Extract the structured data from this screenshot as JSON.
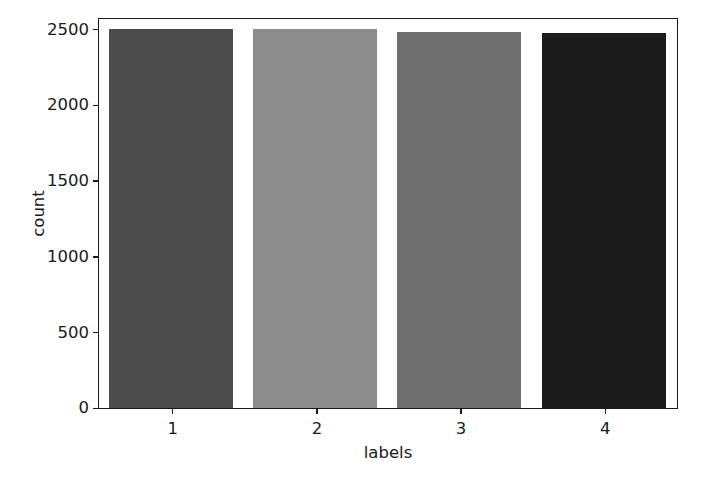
{
  "figure": {
    "width": 701,
    "height": 479,
    "background_color": "#ffffff",
    "spine_color": "#1a1a1a",
    "text_color": "#1a1a1a"
  },
  "chart_data": {
    "type": "bar",
    "title": "",
    "xlabel": "labels",
    "ylabel": "count",
    "categories": [
      "1",
      "2",
      "3",
      "4"
    ],
    "values": [
      2500,
      2500,
      2482,
      2478
    ],
    "bar_colors": [
      "#4c4c4c",
      "#8d8d8d",
      "#6e6e6e",
      "#1b1b1b"
    ],
    "xtick_labels": [
      "1",
      "2",
      "3",
      "4"
    ],
    "ytick_labels": [
      "0",
      "500",
      "1000",
      "1500",
      "2000",
      "2500"
    ],
    "ytick_values": [
      0,
      500,
      1000,
      1500,
      2000,
      2500
    ],
    "ylim": [
      0,
      2560
    ],
    "xlim": [
      0.5,
      4.5
    ],
    "grid": false,
    "legend": false,
    "legend_position": "none",
    "bar_width": 0.86
  }
}
